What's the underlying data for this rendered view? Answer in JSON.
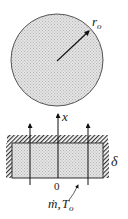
{
  "top_view": {
    "radius_label": "r",
    "radius_sub": "o"
  },
  "side_view": {
    "axis_label": "x",
    "thickness_label": "δ",
    "origin_label": "0",
    "inlet_label_m": "ṁ,",
    "inlet_label_T": "T",
    "inlet_label_T_sub": "o"
  }
}
